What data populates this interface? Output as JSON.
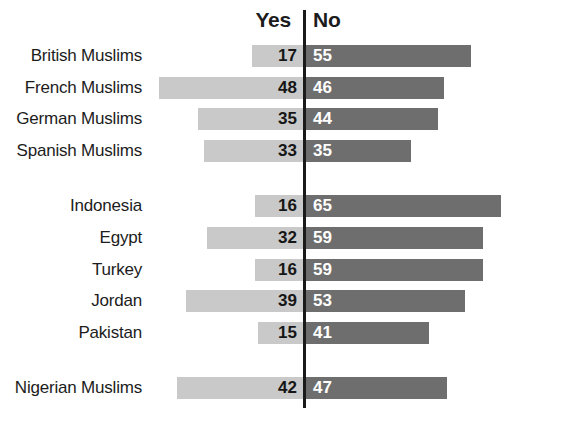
{
  "chart_data": {
    "type": "bar",
    "title": "",
    "subtitle": "",
    "xlabel": "",
    "ylabel": "",
    "grid": false,
    "legend_position": "top-center",
    "orientation": "horizontal-diverging",
    "axis_center_label": "",
    "xlim": [
      0,
      95
    ],
    "categories": [
      "British Muslims",
      "French Muslims",
      "German Muslims",
      "Spanish Muslims",
      "Indonesia",
      "Egypt",
      "Turkey",
      "Jordan",
      "Pakistan",
      "Nigerian Muslims"
    ],
    "group_breaks_after": [
      "Spanish Muslims",
      "Pakistan"
    ],
    "series": [
      {
        "name": "Yes",
        "color": "#c9c9c9",
        "direction": "left",
        "values": [
          17,
          48,
          35,
          33,
          16,
          32,
          16,
          39,
          15,
          42
        ]
      },
      {
        "name": "No",
        "color": "#6e6e6e",
        "direction": "right",
        "values": [
          55,
          46,
          44,
          35,
          65,
          59,
          59,
          53,
          41,
          47
        ]
      }
    ],
    "rows": [
      {
        "label": "British Muslims",
        "yes": 17,
        "no": 55
      },
      {
        "label": "French Muslims",
        "yes": 48,
        "no": 46
      },
      {
        "label": "German Muslims",
        "yes": 35,
        "no": 44
      },
      {
        "label": "Spanish Muslims",
        "yes": 33,
        "no": 35
      },
      {
        "label": "Indonesia",
        "yes": 16,
        "no": 65
      },
      {
        "label": "Egypt",
        "yes": 32,
        "no": 59
      },
      {
        "label": "Turkey",
        "yes": 16,
        "no": 59
      },
      {
        "label": "Jordan",
        "yes": 39,
        "no": 53
      },
      {
        "label": "Pakistan",
        "yes": 15,
        "no": 41
      },
      {
        "label": "Nigerian Muslims",
        "yes": 42,
        "no": 47
      }
    ]
  },
  "headers": {
    "yes": "Yes",
    "no": "No"
  },
  "style": {
    "yes_color": "#c9c9c9",
    "no_color": "#6e6e6e",
    "divider_color": "#1a1a1a",
    "background": "#ffffff",
    "text_color": "#1c1c1c",
    "no_value_text_color": "#ffffff"
  }
}
